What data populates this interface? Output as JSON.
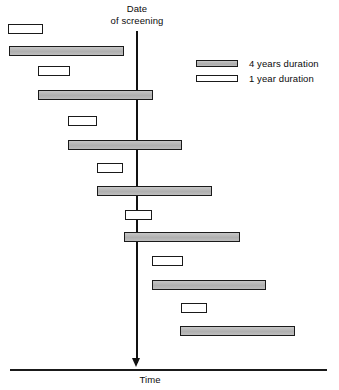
{
  "chart_data": {
    "type": "bar",
    "title": "Date\nof screening",
    "xlabel": "Time",
    "ylabel": "",
    "grid": false,
    "legend_position": "upper-right",
    "annotations": [
      {
        "name": "screening-date-marker",
        "text": "Date\nof screening",
        "x_px": 137
      },
      {
        "name": "time-axis-label",
        "text": "Time"
      }
    ],
    "legend": [
      {
        "key": "four-year",
        "label": "4 years duration",
        "color": "#b9b9b9",
        "duration_years": 4
      },
      {
        "key": "one-year",
        "label": "1 year duration",
        "color": "#ffffff",
        "duration_years": 1
      }
    ],
    "series": [
      {
        "name": "4 years duration",
        "duration_years": 4,
        "color": "#b9b9b9"
      },
      {
        "name": "1 year duration",
        "duration_years": 1,
        "color": "#ffffff"
      }
    ],
    "axis": {
      "screening_line_x_px": 137,
      "time_axis_y_px": 370,
      "time_axis_x_start_px": 10,
      "time_axis_x_end_px": 327
    },
    "bars": [
      {
        "index": 1,
        "series": "one-year",
        "x_start_px": 8,
        "x_end_px": 43,
        "y_px": 24,
        "crosses_screening": false
      },
      {
        "index": 2,
        "series": "four-year",
        "x_start_px": 9,
        "x_end_px": 124,
        "y_px": 46,
        "crosses_screening": false
      },
      {
        "index": 3,
        "series": "one-year",
        "x_start_px": 38,
        "x_end_px": 70,
        "y_px": 66,
        "crosses_screening": false
      },
      {
        "index": 4,
        "series": "four-year",
        "x_start_px": 38,
        "x_end_px": 153,
        "y_px": 90,
        "crosses_screening": true
      },
      {
        "index": 5,
        "series": "one-year",
        "x_start_px": 68,
        "x_end_px": 97,
        "y_px": 116,
        "crosses_screening": false
      },
      {
        "index": 6,
        "series": "four-year",
        "x_start_px": 68,
        "x_end_px": 182,
        "y_px": 140,
        "crosses_screening": true
      },
      {
        "index": 7,
        "series": "one-year",
        "x_start_px": 97,
        "x_end_px": 123,
        "y_px": 163,
        "crosses_screening": false
      },
      {
        "index": 8,
        "series": "four-year",
        "x_start_px": 97,
        "x_end_px": 212,
        "y_px": 186,
        "crosses_screening": true
      },
      {
        "index": 9,
        "series": "one-year",
        "x_start_px": 125,
        "x_end_px": 152,
        "y_px": 210,
        "crosses_screening": true
      },
      {
        "index": 10,
        "series": "four-year",
        "x_start_px": 124,
        "x_end_px": 240,
        "y_px": 232,
        "crosses_screening": true
      },
      {
        "index": 11,
        "series": "one-year",
        "x_start_px": 152,
        "x_end_px": 183,
        "y_px": 256,
        "crosses_screening": false
      },
      {
        "index": 12,
        "series": "four-year",
        "x_start_px": 152,
        "x_end_px": 266,
        "y_px": 280,
        "crosses_screening": false
      },
      {
        "index": 13,
        "series": "one-year",
        "x_start_px": 181,
        "x_end_px": 207,
        "y_px": 303,
        "crosses_screening": false
      },
      {
        "index": 14,
        "series": "four-year",
        "x_start_px": 180,
        "x_end_px": 295,
        "y_px": 326,
        "crosses_screening": false
      }
    ]
  },
  "labels": {
    "screening": "Date\nof screening",
    "time": "Time"
  }
}
